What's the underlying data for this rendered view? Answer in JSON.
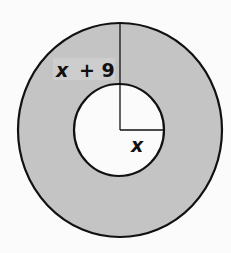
{
  "diagram": {
    "type": "annulus",
    "colors": {
      "ring_fill": "#c4c4c4",
      "inner_fill": "#fbfbfb",
      "stroke": "#111111",
      "background": "#fbfbfb"
    },
    "outer_circle": {
      "cx": 120,
      "cy": 130,
      "rx": 102,
      "ry": 107
    },
    "inner_circle": {
      "cx": 119,
      "cy": 130,
      "rx": 45,
      "ry": 46
    },
    "labels": {
      "outer_radius_var": "x",
      "outer_radius_op": "+ 9",
      "inner_radius": "x"
    }
  }
}
